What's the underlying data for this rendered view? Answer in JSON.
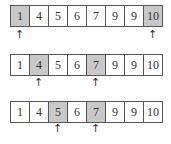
{
  "arrow_glyph": "↑",
  "rows": [
    {
      "values": [
        "1",
        "4",
        "5",
        "6",
        "7",
        "9",
        "9",
        "10"
      ],
      "highlighted": [
        0,
        7
      ],
      "pointers": [
        0,
        7
      ]
    },
    {
      "values": [
        "1",
        "4",
        "5",
        "6",
        "7",
        "9",
        "9",
        "10"
      ],
      "highlighted": [
        1,
        4
      ],
      "pointers": [
        1,
        4
      ]
    },
    {
      "values": [
        "1",
        "4",
        "5",
        "6",
        "7",
        "9",
        "9",
        "10"
      ],
      "highlighted": [
        2,
        4
      ],
      "pointers": [
        2,
        4
      ]
    }
  ]
}
